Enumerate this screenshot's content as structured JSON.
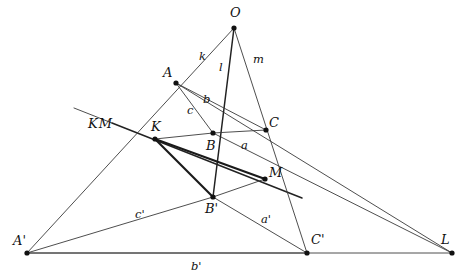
{
  "figure": {
    "width": 475,
    "height": 278,
    "background": "#ffffff",
    "ink_color": "#2b2b2b"
  },
  "points": [
    {
      "id": "O",
      "label": "O",
      "x": 234,
      "y": 28,
      "label_x": 230,
      "label_y": 6,
      "role": "center-of-perspectivity"
    },
    {
      "id": "A",
      "label": "A",
      "x": 176,
      "y": 83,
      "label_x": 163,
      "label_y": 66,
      "role": "triangle-vertex"
    },
    {
      "id": "B",
      "label": "B",
      "x": 213,
      "y": 133,
      "label_x": 206,
      "label_y": 139,
      "role": "triangle-vertex"
    },
    {
      "id": "C",
      "label": "C",
      "x": 266,
      "y": 130,
      "label_x": 269,
      "label_y": 116,
      "role": "triangle-vertex"
    },
    {
      "id": "K",
      "label": "K",
      "x": 155,
      "y": 139,
      "label_x": 151,
      "label_y": 120,
      "role": "axis-point"
    },
    {
      "id": "M",
      "label": "M",
      "x": 265,
      "y": 179,
      "label_x": 269,
      "label_y": 166,
      "role": "axis-point"
    },
    {
      "id": "Ap",
      "label": "A'",
      "x": 27,
      "y": 253,
      "label_x": 13,
      "label_y": 234,
      "role": "triangle-vertex"
    },
    {
      "id": "Bp",
      "label": "B'",
      "x": 213,
      "y": 197,
      "label_x": 205,
      "label_y": 202,
      "role": "triangle-vertex"
    },
    {
      "id": "Cp",
      "label": "C'",
      "x": 307,
      "y": 253,
      "label_x": 311,
      "label_y": 233,
      "role": "triangle-vertex"
    },
    {
      "id": "L",
      "label": "L",
      "x": 452,
      "y": 253,
      "label_x": 441,
      "label_y": 233,
      "role": "axis-point"
    }
  ],
  "segment_labels": [
    {
      "text": "k",
      "x": 199,
      "y": 51,
      "for": "line-O-A"
    },
    {
      "text": "l",
      "x": 219,
      "y": 62,
      "for": "line-O-B"
    },
    {
      "text": "m",
      "x": 253,
      "y": 54,
      "for": "line-O-C"
    },
    {
      "text": "b",
      "x": 203,
      "y": 94,
      "for": "segment-A-C"
    },
    {
      "text": "c",
      "x": 187,
      "y": 105,
      "for": "segment-A-B"
    },
    {
      "text": "a",
      "x": 241,
      "y": 140,
      "for": "segment-B-C"
    },
    {
      "text": "c'",
      "x": 135,
      "y": 209,
      "for": "segment-Ap-Bp"
    },
    {
      "text": "a'",
      "x": 261,
      "y": 214,
      "for": "segment-Bp-Cp"
    },
    {
      "text": "b'",
      "x": 191,
      "y": 261,
      "for": "segment-Ap-Cp"
    }
  ],
  "line_names": [
    {
      "text": "KM",
      "x": 88,
      "y": 117,
      "for": "perspective-axis"
    }
  ],
  "lines": [
    {
      "id": "line-O-A-Ap",
      "from": "O",
      "to": "Ap",
      "weight": "thin",
      "name": "ray-k-through-A-and-A-prime"
    },
    {
      "id": "line-O-B-Bp",
      "from": "O",
      "to": "Bp",
      "weight": "medium",
      "name": "ray-l-through-B-and-B-prime"
    },
    {
      "id": "line-O-C-Cp",
      "from": "O",
      "to": "Cp",
      "weight": "thin",
      "name": "ray-m-through-C-and-C-prime"
    },
    {
      "id": "line-A-B",
      "from": "A",
      "to": "B",
      "weight": "thin",
      "name": "side-c-of-triangle-ABC"
    },
    {
      "id": "line-A-C",
      "from": "A",
      "to": "C",
      "weight": "thin",
      "name": "side-b-of-triangle-ABC"
    },
    {
      "id": "line-B-C",
      "from": "B",
      "to": "C",
      "weight": "thin",
      "name": "side-a-of-triangle-ABC"
    },
    {
      "id": "line-Ap-Bp",
      "from": "Ap",
      "to": "Bp",
      "weight": "thin",
      "name": "side-c-prime-of-triangle"
    },
    {
      "id": "line-Ap-Cp",
      "from": "Ap",
      "to": "Cp",
      "weight": "thin",
      "name": "side-b-prime-of-triangle"
    },
    {
      "id": "line-Bp-Cp",
      "from": "Bp",
      "to": "Cp",
      "weight": "thin",
      "name": "side-a-prime-of-triangle"
    },
    {
      "id": "line-K-B",
      "from": "K",
      "to": "B",
      "weight": "thin",
      "name": "axis-chord-K-to-B"
    },
    {
      "id": "line-K-M",
      "from": "K",
      "to": "M",
      "weight": "bold",
      "name": "perspective-axis-K-M"
    },
    {
      "id": "line-K-Bp",
      "from": "K",
      "to": "Bp",
      "weight": "bold",
      "name": "axis-chord-K-to-B-prime"
    },
    {
      "id": "line-Bp-M",
      "from": "Bp",
      "to": "M",
      "weight": "thin",
      "name": "axis-chord-B-prime-to-M"
    }
  ],
  "extended_lines": [
    {
      "id": "axis-extended",
      "x1": 112,
      "y1": 123,
      "x2": 302,
      "y2": 198,
      "weight": "medium",
      "name": "perspective-axis-extended-KM"
    },
    {
      "id": "side-b-extended",
      "x1": 176,
      "y1": 83,
      "x2": 452,
      "y2": 253,
      "weight": "thin",
      "name": "side-b-extended-to-L"
    },
    {
      "id": "side-a-extended",
      "x1": 213,
      "y1": 133,
      "x2": 452,
      "y2": 253,
      "weight": "thin",
      "name": "side-a-extended-to-L"
    },
    {
      "id": "base-extended",
      "x1": 27,
      "y1": 253,
      "x2": 452,
      "y2": 253,
      "weight": "thin",
      "name": "base-line-b-prime-extended-to-L"
    },
    {
      "id": "axis-left-tail",
      "x1": 112,
      "y1": 123,
      "x2": 74,
      "y2": 108,
      "weight": "thin",
      "name": "axis-left-tail-toward-label"
    }
  ]
}
